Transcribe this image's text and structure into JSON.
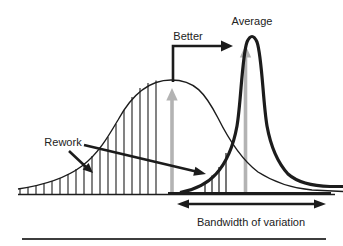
{
  "diagram": {
    "labels": {
      "average": "Average",
      "better": "Better",
      "rework": "Rework",
      "bandwidth": "Bandwidth of variation"
    },
    "colors": {
      "ink": "#1c1c1c",
      "gray_arrow": "#b3b3b3",
      "rule": "#3d3d3d"
    }
  }
}
